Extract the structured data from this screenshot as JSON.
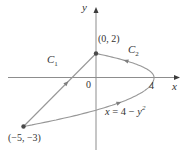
{
  "figure": {
    "background": "#ffffff",
    "curve_color": "#979797",
    "axis_color": "#8d8d8d",
    "arrow_color": "#7f7f7f",
    "axis_arrow_color": "#3c3c3c",
    "dot_color": "#4a4a4a",
    "text_color": "#333333",
    "axes": {
      "x_label": "x",
      "y_label": "y",
      "origin_label": "0",
      "x_tick_label": "4"
    },
    "points": [
      {
        "name": "point-0-2",
        "label": "(0, 2)",
        "x": 0,
        "y": 2
      },
      {
        "name": "point-m5-m3",
        "label": "(−5, −3)",
        "x": -5,
        "y": -3
      }
    ],
    "curves": [
      {
        "name": "C1",
        "label_main": "C",
        "label_sub": "1",
        "type": "segment",
        "from": [
          -5,
          -3
        ],
        "to": [
          0,
          2
        ]
      },
      {
        "name": "C2",
        "label_main": "C",
        "label_sub": "2",
        "type": "parabola",
        "equation": "x = 4 − y²",
        "y_from": -3,
        "y_to": 2
      }
    ],
    "equation_parts": [
      {
        "text": "x",
        "italic": true
      },
      {
        "text": " = 4 − ",
        "italic": false
      },
      {
        "text": "y",
        "italic": true
      },
      {
        "text": "2",
        "italic": true,
        "sup": true
      }
    ]
  },
  "geometry": {
    "origin_px": [
      96,
      77.5
    ],
    "x_scale": 14.5,
    "y_scale_pos": 12,
    "y_scale_neg": 16.33,
    "x_axis_px": [
      8,
      176
    ],
    "x_axis_tip": [
      180,
      77.5
    ],
    "y_axis_px": [
      150,
      11
    ],
    "y_axis_tip": [
      96,
      7
    ],
    "dot_radius": 2.2,
    "c1_arrow_frac": 0.62,
    "parabola_lower_arrow_t": -1.5,
    "parabola_upper_arrow_t": 1.45
  }
}
